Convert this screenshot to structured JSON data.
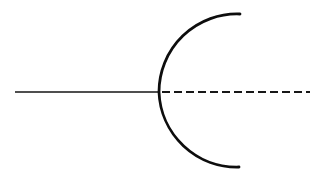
{
  "figure": {
    "background_color": "#ffffff",
    "width": 322,
    "height": 178,
    "stroke_color": "#0d0d0d",
    "axis_color": "#151515",
    "title": "",
    "caption": ""
  },
  "chart_data": {
    "type": "line",
    "title": "",
    "subtitle": "",
    "xlabel": "",
    "ylabel": "",
    "xlim": [
      0,
      322
    ],
    "ylim": [
      178,
      0
    ],
    "grid": false,
    "legend": null,
    "annotations": [],
    "tick_labels": {
      "x": [],
      "y": []
    },
    "axis_line": {
      "name": "optical-axis",
      "y": 92,
      "solid_segment": {
        "x_start": 15,
        "x_end": 160,
        "stroke_width": 1.4,
        "style": "solid"
      },
      "dashed_segment": {
        "x_start": 162,
        "x_end": 310,
        "stroke_width": 1.8,
        "style": "dashed",
        "dash": 8,
        "gap": 4
      }
    },
    "series": [
      {
        "name": "concave-arc",
        "style": "solid",
        "stroke_width": 2.8,
        "shape": "circular-arc",
        "opens": "right",
        "center": [
          237,
          92
        ],
        "radius": 78,
        "vertex": [
          159,
          92
        ],
        "start_point": [
          240,
          14
        ],
        "end_point": [
          239,
          167
        ],
        "sweep_degrees": 180,
        "path": "M 240 14 A 78 78 0 0 0 159 92 A 78 78 0 0 0 239 167"
      }
    ]
  }
}
